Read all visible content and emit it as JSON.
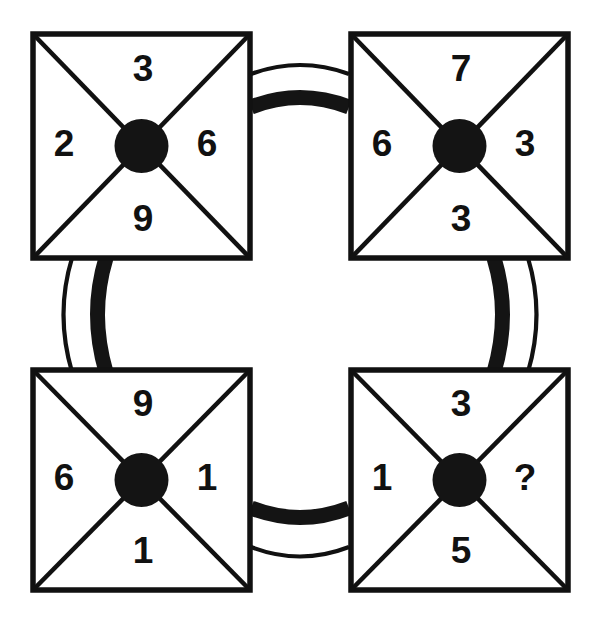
{
  "diagram": {
    "type": "four-cell-number-puzzle",
    "colors": {
      "ink": "#111111",
      "hub": "#141414",
      "background": "#ffffff"
    },
    "unknown_marker": "?",
    "cells": [
      {
        "id": "top-left",
        "position": "top-left",
        "top": "3",
        "left": "2",
        "right": "6",
        "bottom": "9"
      },
      {
        "id": "top-right",
        "position": "top-right",
        "top": "7",
        "left": "6",
        "right": "3",
        "bottom": "3"
      },
      {
        "id": "bottom-left",
        "position": "bottom-left",
        "top": "9",
        "left": "6",
        "right": "1",
        "bottom": "1"
      },
      {
        "id": "bottom-right",
        "position": "bottom-right",
        "top": "3",
        "left": "1",
        "right": "?",
        "bottom": "5"
      }
    ],
    "connectors": [
      {
        "id": "top",
        "from": "top-left",
        "to": "top-right",
        "orientation": "horizontal",
        "bow": "up"
      },
      {
        "id": "left",
        "from": "top-left",
        "to": "bottom-left",
        "orientation": "vertical",
        "bow": "left"
      },
      {
        "id": "right",
        "from": "top-right",
        "to": "bottom-right",
        "orientation": "vertical",
        "bow": "right"
      },
      {
        "id": "bottom",
        "from": "bottom-left",
        "to": "bottom-right",
        "orientation": "horizontal",
        "bow": "down"
      }
    ]
  }
}
